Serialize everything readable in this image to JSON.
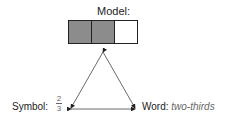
{
  "model": {
    "label": "Model:",
    "parts": 3,
    "shaded": 2,
    "shade_color": "#8c8c8c",
    "empty_color": "#ffffff"
  },
  "symbol": {
    "label": "Symbol:",
    "numerator": "2",
    "denominator": "3"
  },
  "word": {
    "label": "Word:",
    "value": "two-thirds"
  }
}
